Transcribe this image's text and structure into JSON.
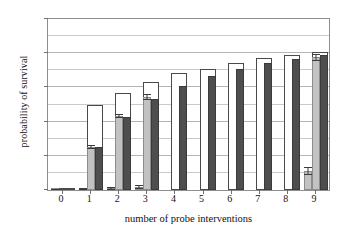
{
  "chart_data": {
    "type": "bar",
    "title": "",
    "xlabel": "number of probe interventions",
    "ylabel": "probability of survival",
    "categories": [
      "0",
      "1",
      "2",
      "3",
      "4",
      "5",
      "6",
      "7",
      "8",
      "9"
    ],
    "xlim": [
      -0.5,
      9.5
    ],
    "ylim": [
      0,
      1
    ],
    "yticks": [
      0,
      0.2,
      0.4,
      0.6,
      0.8,
      1
    ],
    "ytick_labels": [
      "0",
      "0.2",
      "0.4",
      "0.6",
      "0.8",
      "1"
    ],
    "gridlines": [
      0.1,
      0.2,
      0.3,
      0.4,
      0.5,
      0.6,
      0.7,
      0.8,
      0.9
    ],
    "grid": true,
    "legend": "none",
    "series": [
      {
        "name": "white",
        "color": "#ffffff",
        "edge_color": "#4a4a4a",
        "values": [
          0.005,
          0.5,
          0.565,
          0.63,
          0.685,
          0.71,
          0.745,
          0.77,
          0.79,
          0.805
        ],
        "errors": [
          0,
          0,
          0,
          0,
          0,
          0,
          0,
          0,
          0,
          0
        ]
      },
      {
        "name": "light-gray",
        "color": "#c2c2c2",
        "edge_color": "#8c8c8c",
        "values": [
          0.004,
          0.252,
          0.435,
          0.545,
          0.0,
          0.0,
          0.0,
          0.0,
          0.0,
          0.775
        ],
        "errors": [
          0.003,
          0.012,
          0.012,
          0.018,
          0,
          0,
          0,
          0,
          0,
          0.018
        ]
      },
      {
        "name": "dark-gray",
        "color": "#4e4e4e",
        "edge_color": "#3a3a3a",
        "values": [
          0.003,
          0.252,
          0.425,
          0.532,
          0.61,
          0.665,
          0.705,
          0.74,
          0.765,
          0.79
        ],
        "errors": [
          0,
          0,
          0,
          0,
          0,
          0,
          0,
          0,
          0,
          0
        ]
      },
      {
        "name": "light-gray-small",
        "color": "#c2c2c2",
        "edge_color": "#8c8c8c",
        "values": [
          0.004,
          0.004,
          0.008,
          0.018,
          0.0,
          0.0,
          0.0,
          0.0,
          0.0,
          0.11
        ],
        "errors": [
          0.004,
          0.006,
          0.009,
          0.014,
          0,
          0,
          0,
          0,
          0,
          0.025
        ]
      }
    ]
  }
}
